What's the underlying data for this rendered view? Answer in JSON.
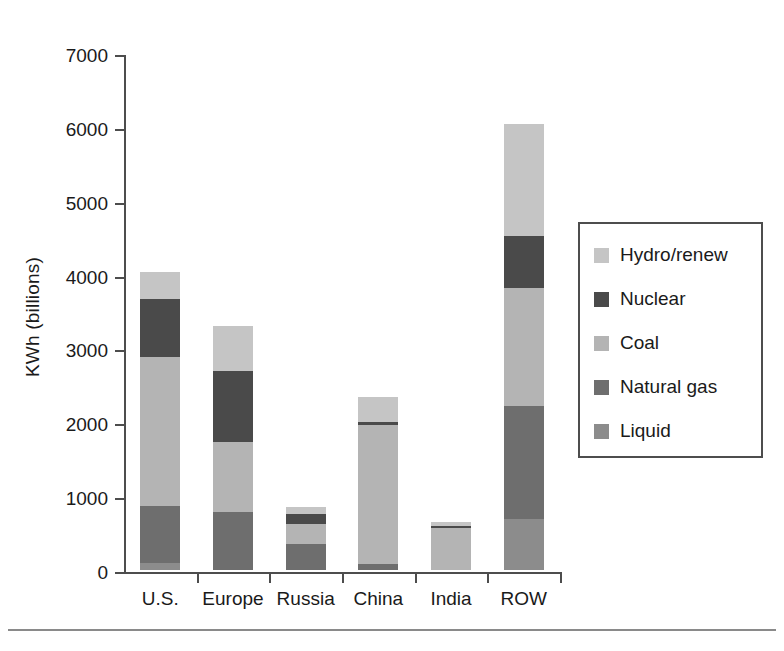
{
  "chart_data": {
    "type": "bar",
    "subtype": "stacked",
    "title": "",
    "xlabel": "",
    "ylabel": "KWh (billions)",
    "ylim": [
      0,
      7000
    ],
    "ytick_labels": [
      "0",
      "1000",
      "2000",
      "3000",
      "4000",
      "5000",
      "6000",
      "7000"
    ],
    "ytick_values": [
      0,
      1000,
      2000,
      3000,
      4000,
      5000,
      6000,
      7000
    ],
    "grid": false,
    "legend_position": "right",
    "categories": [
      "U.S.",
      "Europe",
      "Russia",
      "China",
      "India",
      "ROW"
    ],
    "series": [
      {
        "name": "Liquid",
        "color": "#8c8c8c",
        "values": [
          100,
          0,
          0,
          0,
          0,
          690
        ]
      },
      {
        "name": "Natural gas",
        "color": "#6e6e6e",
        "values": [
          770,
          780,
          350,
          80,
          0,
          1530
        ]
      },
      {
        "name": "Coal",
        "color": "#b4b4b4",
        "values": [
          2020,
          950,
          270,
          1880,
          570,
          1600
        ]
      },
      {
        "name": "Nuclear",
        "color": "#4a4a4a",
        "values": [
          780,
          970,
          140,
          50,
          20,
          700
        ]
      },
      {
        "name": "Hydro/renew",
        "color": "#c5c5c5",
        "values": [
          370,
          600,
          100,
          330,
          60,
          1520
        ]
      }
    ],
    "totals": [
      4040,
      3300,
      860,
      2340,
      650,
      6040
    ],
    "legend_entries": [
      "Hydro/renew",
      "Nuclear",
      "Coal",
      "Natural gas",
      "Liquid"
    ]
  },
  "colors": {
    "axis": "#4d4d4d",
    "text": "#1a1a1a",
    "background": "#ffffff",
    "rule": "#8a8a8a"
  }
}
